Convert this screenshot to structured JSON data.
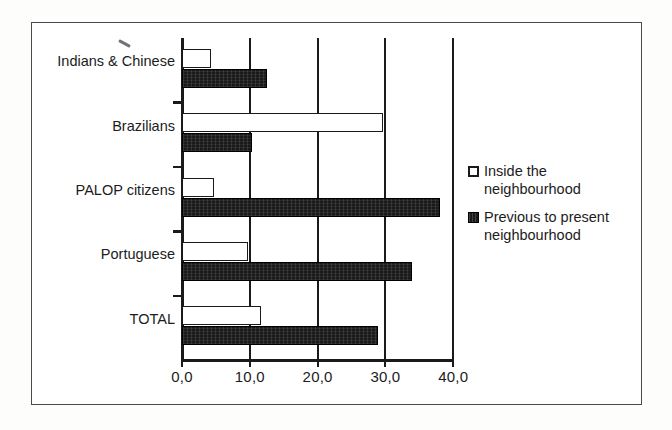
{
  "chart_data": {
    "type": "bar",
    "orientation": "horizontal",
    "title": "",
    "xlabel": "",
    "ylabel": "",
    "categories": [
      "Indians & Chinese",
      "Brazilians",
      "PALOP citizens",
      "Portuguese",
      "TOTAL"
    ],
    "series": [
      {
        "name": "Inside the neighbourhood",
        "color": "#ffffff",
        "edge_color": "#1a1a1a",
        "values": [
          4.3,
          29.6,
          4.7,
          9.7,
          11.6
        ]
      },
      {
        "name": "Previous to present neighbourhood",
        "color": "#1a1a1a",
        "edge_color": "#000000",
        "values": [
          12.5,
          10.3,
          38.1,
          33.9,
          28.9
        ]
      }
    ],
    "xlim": [
      0,
      40
    ],
    "xticks": [
      0,
      10,
      20,
      30,
      40
    ],
    "xtick_labels": [
      "0,0",
      "10,0",
      "20,0",
      "30,0",
      "40,0"
    ],
    "grid": true,
    "grid_axis": "x",
    "legend_position": "right"
  },
  "legend": {
    "items": [
      {
        "label_line1": "Inside the",
        "label_line2": "neighbourhood",
        "marker": "hollow-square"
      },
      {
        "label_line1": "Previous to present",
        "label_line2": "neighbourhood",
        "marker": "filled-square"
      }
    ]
  }
}
